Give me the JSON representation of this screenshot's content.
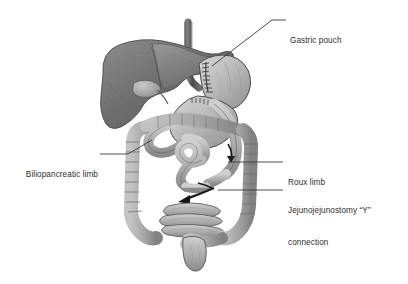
{
  "figure": {
    "background_color": "#ffffff",
    "text_color": "#2e2e2e",
    "leader_color": "#3a3a3a"
  },
  "labels": [
    {
      "id": "gastric-pouch",
      "text": "Gastric pouch",
      "side": "right",
      "lines": [
        "Gastric pouch"
      ]
    },
    {
      "id": "biliopancreatic-limb",
      "text": "Biliopancreatic limb",
      "side": "left",
      "lines": [
        "Biliopancreatic limb"
      ]
    },
    {
      "id": "roux-limb",
      "text": "Roux limb",
      "side": "right",
      "lines": [
        "Roux limb"
      ]
    },
    {
      "id": "jejunojejunostomy",
      "text": "Jejunojejunostomy \"Y\" connection",
      "side": "right",
      "lines": [
        "Jejunojejunostomy “Y”",
        "connection"
      ]
    }
  ],
  "anatomy": {
    "parts": [
      {
        "name": "esophagus",
        "tone": "#555555"
      },
      {
        "name": "liver",
        "tone": "#6f6f6f"
      },
      {
        "name": "gallbladder",
        "tone": "#9a9a9a"
      },
      {
        "name": "gastric-pouch",
        "tone": "#bdbdbd"
      },
      {
        "name": "remnant-stomach",
        "tone": "#b4b4b4"
      },
      {
        "name": "staple-line",
        "tone": "#3c3c3c"
      },
      {
        "name": "roux-limb",
        "tone": "#b6b6b6"
      },
      {
        "name": "biliopancreatic-limb",
        "tone": "#b0b0b0"
      },
      {
        "name": "colon",
        "tone": "#a8a8a8"
      },
      {
        "name": "small-bowel",
        "tone": "#b2b2b2"
      },
      {
        "name": "rectum",
        "tone": "#9e9e9e"
      },
      {
        "name": "flow-arrow",
        "tone": "#1d1d1d"
      }
    ]
  }
}
